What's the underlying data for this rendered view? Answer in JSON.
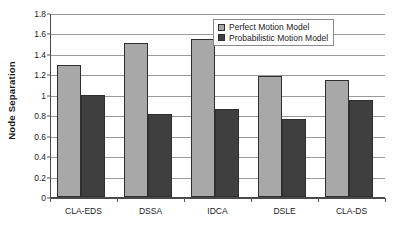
{
  "chart_data": {
    "type": "bar",
    "title": "",
    "xlabel": "",
    "ylabel": "Node Separation",
    "categories": [
      "CLA-EDS",
      "DSSA",
      "IDCA",
      "DSLE",
      "CLA-DS"
    ],
    "series": [
      {
        "name": "Perfect Motion Model",
        "color": "#a8a8a8",
        "values": [
          1.29,
          1.51,
          1.55,
          1.18,
          1.14
        ]
      },
      {
        "name": "Probabilistic Motion Model",
        "color": "#3f3f3f",
        "values": [
          1.0,
          0.81,
          0.86,
          0.76,
          0.95
        ]
      }
    ],
    "ylim": [
      0,
      1.8
    ],
    "ytick_step": 0.2,
    "ytick_labels": [
      "1.8",
      "1.6",
      "1.4",
      "1.2",
      "1",
      "0.8",
      "0.6",
      "0.4",
      "0.2",
      "0"
    ],
    "ytick_values": [
      1.8,
      1.6,
      1.4,
      1.2,
      1.0,
      0.8,
      0.6,
      0.4,
      0.2,
      0
    ],
    "grid": "horizontal",
    "legend_position": "top-right-inside",
    "background": "#ffffff",
    "bar_border_color": "#2f2f2f",
    "gridline_color": "#9a9a9a",
    "axis_color": "#4a4a4a"
  }
}
